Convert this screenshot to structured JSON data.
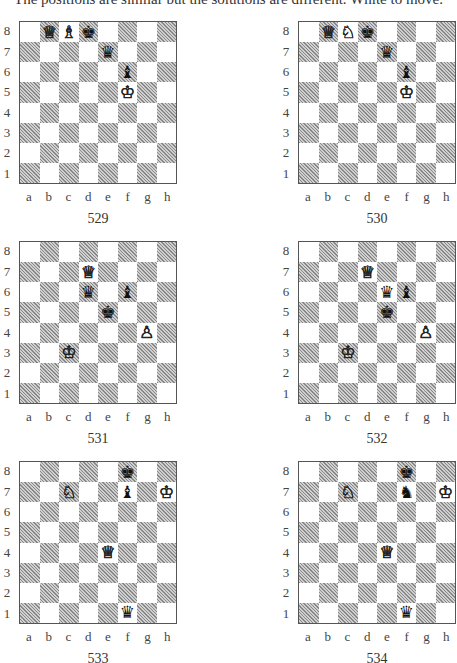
{
  "header": {
    "text": "The positions are similar but the solutions are different. White to move."
  },
  "files": [
    "a",
    "b",
    "c",
    "d",
    "e",
    "f",
    "g",
    "h"
  ],
  "ranks": [
    "8",
    "7",
    "6",
    "5",
    "4",
    "3",
    "2",
    "1"
  ],
  "glyphs": {
    "wK": "♔",
    "wQ": "♕",
    "wR": "♖",
    "wB": "♗",
    "wN": "♘",
    "wP": "♙",
    "bK": "♚",
    "bQ": "♛",
    "bR": "♜",
    "bB": "♝",
    "bN": "♞",
    "bP": "♟"
  },
  "diagrams": [
    {
      "number": "529",
      "pieces": {
        "b8": "wQ",
        "c8": "wB",
        "d8": "bK",
        "e7": "bQ",
        "f6": "bB",
        "f5": "wK"
      }
    },
    {
      "number": "530",
      "pieces": {
        "b8": "wQ",
        "c8": "wN",
        "d8": "bK",
        "e7": "bQ",
        "f6": "bB",
        "f5": "wK"
      }
    },
    {
      "number": "531",
      "pieces": {
        "d7": "wQ",
        "d6": "bQ",
        "f6": "bB",
        "e5": "bK",
        "g4": "wP",
        "c3": "wK"
      }
    },
    {
      "number": "532",
      "pieces": {
        "d7": "wQ",
        "e6": "bQ",
        "f6": "bB",
        "e5": "bK",
        "g4": "wP",
        "c3": "wK"
      }
    },
    {
      "number": "533",
      "pieces": {
        "f8": "bK",
        "c7": "wN",
        "f7": "bB",
        "h7": "wK",
        "e4": "wQ",
        "f1": "bQ"
      }
    },
    {
      "number": "534",
      "pieces": {
        "f8": "bK",
        "c7": "wN",
        "f7": "bN",
        "h7": "wK",
        "e4": "wQ",
        "f1": "bQ"
      }
    }
  ]
}
